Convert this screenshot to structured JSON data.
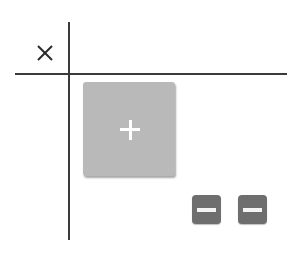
{
  "widget": {
    "colors": {
      "background": "#ffffff",
      "grid_line": "#3a3a3a",
      "add_button_fill": "#b9b9b9",
      "add_button_glyph": "#ffffff",
      "remove_button_fill": "#6e6e6e",
      "remove_button_glyph": "#f4f4f4",
      "close_glyph": "#2a2a2a"
    },
    "close_button": {
      "icon": "close-icon",
      "glyph": "×"
    },
    "add_button": {
      "icon": "plus-icon",
      "glyph": "+"
    },
    "remove_buttons": [
      {
        "icon": "minus-icon",
        "glyph": "−"
      },
      {
        "icon": "minus-icon",
        "glyph": "−"
      }
    ]
  }
}
